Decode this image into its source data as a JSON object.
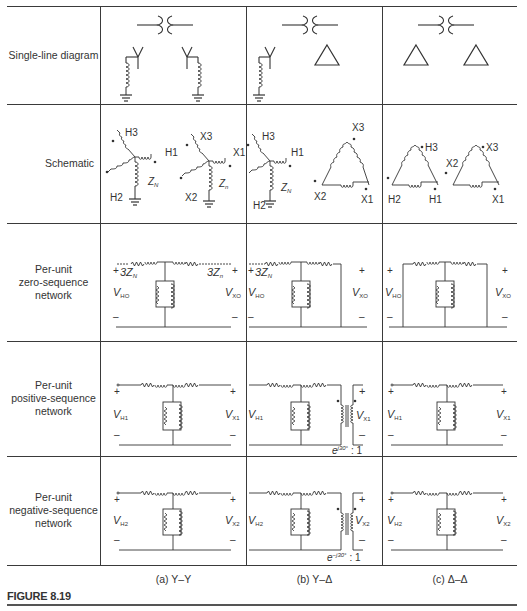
{
  "figure": {
    "label": "FIGURE 8.19",
    "columns": [
      {
        "id": "a",
        "caption": "(a)  Y–Y"
      },
      {
        "id": "b",
        "caption": "(b)  Y–Δ"
      },
      {
        "id": "c",
        "caption": "(c)  Δ–Δ"
      }
    ],
    "rows": [
      {
        "id": "single-line",
        "label_lines": [
          "Single-line diagram"
        ]
      },
      {
        "id": "schematic",
        "label_lines": [
          "Schematic"
        ]
      },
      {
        "id": "zero-seq",
        "label_lines": [
          "Per-unit",
          "zero-sequence",
          "network"
        ]
      },
      {
        "id": "pos-seq",
        "label_lines": [
          "Per-unit",
          "positive-sequence",
          "network"
        ]
      },
      {
        "id": "neg-seq",
        "label_lines": [
          "Per-unit",
          "negative-sequence",
          "network"
        ]
      }
    ]
  },
  "schematic_labels": {
    "a": {
      "H1": "H1",
      "H2": "H2",
      "H3": "H3",
      "X1": "X1",
      "X2": "X2",
      "X3": "X3",
      "ZN": "Z",
      "ZN_sub": "N",
      "Zn": "Z",
      "Zn_sub": "n"
    },
    "b": {
      "H1": "H1",
      "H2": "H2",
      "H3": "H3",
      "X1": "X1",
      "X2": "X2",
      "X3": "X3",
      "ZN": "Z",
      "ZN_sub": "N"
    },
    "c": {
      "H1": "H1",
      "H2": "H2",
      "H3": "H3",
      "X1": "X1",
      "X2": "X2",
      "X3": "X3"
    }
  },
  "networks": {
    "zero": {
      "a": {
        "left_v": "V",
        "left_sub": "HO",
        "right_v": "V",
        "right_sub": "XO",
        "left_imp": "3Z",
        "left_imp_sub": "N",
        "right_imp": "3Z",
        "right_imp_sub": "n",
        "plus": "+",
        "minus": "–"
      },
      "b": {
        "left_v": "V",
        "left_sub": "HO",
        "right_v": "V",
        "right_sub": "XO",
        "left_imp": "3Z",
        "left_imp_sub": "N",
        "plus": "+",
        "minus": "–"
      },
      "c": {
        "left_v": "V",
        "left_sub": "HO",
        "right_v": "V",
        "right_sub": "XO",
        "plus": "+",
        "minus": "–"
      }
    },
    "positive": {
      "a": {
        "left_v": "V",
        "left_sub": "H1",
        "right_v": "V",
        "right_sub": "X1",
        "plus": "+",
        "minus": "–"
      },
      "b": {
        "left_v": "V",
        "left_sub": "H1",
        "right_v": "V",
        "right_sub": "X1",
        "plus": "+",
        "minus": "–",
        "ratio_base": "e",
        "ratio_exp": "j30°",
        "ratio_tail": ": 1"
      },
      "c": {
        "left_v": "V",
        "left_sub": "H1",
        "right_v": "V",
        "right_sub": "X1",
        "plus": "+",
        "minus": "–"
      }
    },
    "negative": {
      "a": {
        "left_v": "V",
        "left_sub": "H2",
        "right_v": "V",
        "right_sub": "X2",
        "plus": "+",
        "minus": "–"
      },
      "b": {
        "left_v": "V",
        "left_sub": "H2",
        "right_v": "V",
        "right_sub": "X2",
        "plus": "+",
        "minus": "–",
        "ratio_base": "e",
        "ratio_exp": "−j30°",
        "ratio_tail": ": 1"
      },
      "c": {
        "left_v": "V",
        "left_sub": "H2",
        "right_v": "V",
        "right_sub": "X2",
        "plus": "+",
        "minus": "–"
      }
    }
  },
  "colors": {
    "ink": "#333333",
    "rule": "#3a3a3a",
    "background": "#ffffff"
  }
}
